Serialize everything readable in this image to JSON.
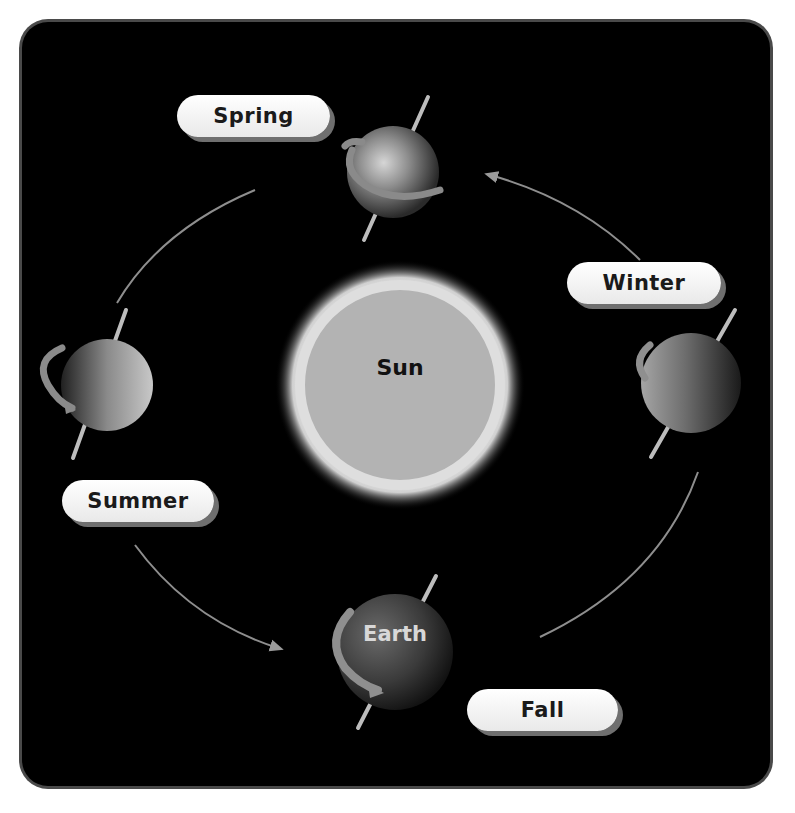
{
  "diagram": {
    "type": "earth-orbit-seasons",
    "colors": {
      "background": "#000000",
      "frame_border": "#4a4a4a",
      "orbit_line": "#9a9a9a",
      "sun_fill": "#b8b8b8",
      "sun_glow": "#e6e6e6",
      "label_pill": "#f2f2f2",
      "label_text": "#1a1a1a"
    },
    "sun": {
      "label": "Sun"
    },
    "earth": {
      "label": "Earth"
    },
    "seasons": [
      {
        "id": "spring",
        "label": "Spring"
      },
      {
        "id": "winter",
        "label": "Winter"
      },
      {
        "id": "summer",
        "label": "Summer"
      },
      {
        "id": "fall",
        "label": "Fall"
      }
    ]
  }
}
